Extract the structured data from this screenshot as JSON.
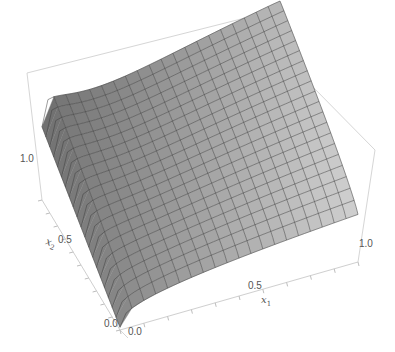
{
  "chart_data": {
    "type": "surface3d",
    "title": "",
    "xlabel": "x1",
    "ylabel": "x2",
    "zlabel": "",
    "x_axis": {
      "label": "x",
      "subscript": "1",
      "ticks": [
        "0.0",
        "0.5",
        "1.0"
      ],
      "range": [
        0,
        1
      ]
    },
    "y_axis": {
      "label": "x",
      "subscript": "2",
      "ticks": [
        "0.0",
        "0.5",
        "1.0"
      ],
      "range": [
        0,
        1
      ]
    },
    "z_axis": {
      "ticks": [],
      "range": [
        0,
        1
      ]
    },
    "mesh": {
      "x_divisions": 20,
      "y_divisions": 20
    },
    "sample_grid": {
      "x": [
        0.0,
        0.25,
        0.5,
        0.75,
        1.0
      ],
      "y": [
        0.0,
        0.25,
        0.5,
        0.75,
        1.0
      ],
      "z": [
        [
          0.0,
          0.18,
          0.28,
          0.35,
          0.4
        ],
        [
          0.02,
          0.4,
          0.55,
          0.63,
          0.68
        ],
        [
          0.05,
          0.55,
          0.7,
          0.78,
          0.83
        ],
        [
          0.1,
          0.66,
          0.8,
          0.87,
          0.91
        ],
        [
          0.15,
          0.74,
          0.86,
          0.93,
          0.97
        ]
      ]
    },
    "colors": {
      "surface_light": "#d8d8d8",
      "surface_dark": "#5a5a5a",
      "mesh": "#3d3d3d",
      "box": "#d6d6d6"
    },
    "grid": false,
    "legend": null
  },
  "labels": {
    "x1_tick_0": "0.0",
    "x1_tick_05": "0.5",
    "x1_tick_1": "1.0",
    "x2_tick_0": "0.0",
    "x2_tick_05": "0.5",
    "x2_tick_1": "1.0",
    "x1_name": "x",
    "x1_sub": "1",
    "x2_name": "x",
    "x2_sub": "2"
  }
}
